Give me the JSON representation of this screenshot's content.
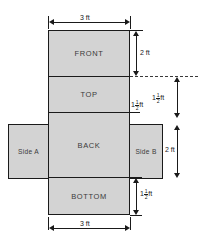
{
  "figure": {
    "fill_color": "#d3d3d3",
    "stroke_color": "#1a1a1a",
    "background_color": "#ffffff"
  },
  "panels": [
    {
      "name": "front",
      "label": "FRONT",
      "width": "3 ft",
      "height": "2 ft"
    },
    {
      "name": "top",
      "label": "TOP",
      "width": "3 ft",
      "height": "1 1/2 ft"
    },
    {
      "name": "back",
      "label": "BACK",
      "width": "3 ft",
      "height": "2 ft"
    },
    {
      "name": "bottom",
      "label": "BOTTOM",
      "width": "3 ft",
      "height": "1 1/2 ft"
    },
    {
      "name": "side-a",
      "label": "Side A",
      "width": "1 1/2 ft",
      "height": "2 ft"
    },
    {
      "name": "side-b",
      "label": "Side B",
      "width": "1 1/2 ft",
      "height": "2 ft"
    }
  ],
  "dimensions": {
    "top_width": {
      "text": "3 ft",
      "value": 3,
      "unit": "ft"
    },
    "bottom_width": {
      "text": "3 ft",
      "value": 3,
      "unit": "ft"
    },
    "front_height": {
      "text": "2 ft",
      "value": 2,
      "unit": "ft"
    },
    "top_height_inner": {
      "whole": "1",
      "num": "1",
      "den": "2",
      "unit": "ft",
      "value": 1.5
    },
    "top_height_outer": {
      "whole": "1",
      "num": "1",
      "den": "2",
      "unit": "ft",
      "value": 1.5
    },
    "back_height": {
      "text": "2 ft",
      "value": 2,
      "unit": "ft"
    },
    "bottom_height": {
      "whole": "1",
      "num": "1",
      "den": "2",
      "unit": "ft",
      "value": 1.5
    }
  }
}
